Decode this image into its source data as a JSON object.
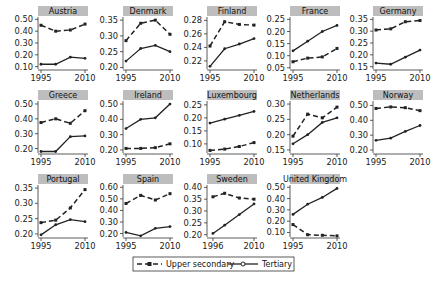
{
  "chart_data": {
    "type": "line",
    "layout": "small-multiples",
    "x": [
      1995,
      2000,
      2005,
      2010
    ],
    "legend": {
      "placement": "bottom-center",
      "entries": [
        {
          "name": "Upper secondary",
          "style": "dashed",
          "marker": "square"
        },
        {
          "name": "Tertiary",
          "style": "solid",
          "marker": "circle"
        }
      ]
    },
    "panels": [
      {
        "title": "Austria",
        "xticks": [
          "1995",
          "2010"
        ],
        "yticks": [
          "0.10",
          "0.20",
          "0.30",
          "0.40",
          "0.50"
        ],
        "ylim": [
          0.08,
          0.52
        ],
        "series": [
          {
            "name": "Upper secondary",
            "values": [
              0.45,
              0.4,
              0.41,
              0.46
            ]
          },
          {
            "name": "Tertiary",
            "values": [
              0.12,
              0.12,
              0.18,
              0.17
            ]
          }
        ]
      },
      {
        "title": "Denmark",
        "xticks": [
          "1995",
          "2010"
        ],
        "yticks": [
          "0.20",
          "0.25",
          "0.30",
          "0.35"
        ],
        "ylim": [
          0.195,
          0.36
        ],
        "series": [
          {
            "name": "Upper secondary",
            "values": [
              0.285,
              0.34,
              0.35,
              0.305
            ]
          },
          {
            "name": "Tertiary",
            "values": [
              0.22,
              0.26,
              0.27,
              0.25
            ]
          }
        ]
      },
      {
        "title": "Finland",
        "xticks": [
          "1995",
          "2010"
        ],
        "yticks": [
          "0.22",
          "0.24",
          "0.26",
          "0.28"
        ],
        "ylim": [
          0.208,
          0.285
        ],
        "series": [
          {
            "name": "Upper secondary",
            "values": [
              0.242,
              0.278,
              0.274,
              0.273
            ]
          },
          {
            "name": "Tertiary",
            "values": [
              0.212,
              0.238,
              0.245,
              0.253
            ]
          }
        ]
      },
      {
        "title": "France",
        "xticks": [
          "1995",
          "2010"
        ],
        "yticks": [
          "0.05",
          "0.10",
          "0.15",
          "0.20",
          "0.25"
        ],
        "ylim": [
          0.045,
          0.26
        ],
        "series": [
          {
            "name": "Upper secondary",
            "values": [
              0.075,
              0.09,
              0.095,
              0.13
            ]
          },
          {
            "name": "Tertiary",
            "values": [
              0.12,
              0.16,
              0.2,
              0.225
            ]
          }
        ]
      },
      {
        "title": "Germany",
        "xticks": [
          "1995",
          "2010"
        ],
        "yticks": [
          "0.15",
          "0.20",
          "0.25",
          "0.30",
          "0.35"
        ],
        "ylim": [
          0.14,
          0.36
        ],
        "series": [
          {
            "name": "Upper secondary",
            "values": [
              0.305,
              0.31,
              0.34,
              0.345
            ]
          },
          {
            "name": "Tertiary",
            "values": [
              0.165,
              0.16,
              0.19,
              0.22
            ]
          }
        ]
      },
      {
        "title": "Greece",
        "xticks": [
          "1995",
          "2010"
        ],
        "yticks": [
          "0.20",
          "0.30",
          "0.40",
          "0.50"
        ],
        "ylim": [
          0.17,
          0.52
        ],
        "series": [
          {
            "name": "Upper secondary",
            "values": [
              0.375,
              0.4,
              0.37,
              0.455
            ]
          },
          {
            "name": "Tertiary",
            "values": [
              0.18,
              0.18,
              0.28,
              0.285
            ]
          }
        ]
      },
      {
        "title": "Ireland",
        "xticks": [
          "1995",
          "2010"
        ],
        "yticks": [
          "0.20",
          "0.30",
          "0.40",
          "0.50"
        ],
        "ylim": [
          0.18,
          0.52
        ],
        "series": [
          {
            "name": "Upper secondary",
            "values": [
              0.21,
              0.21,
              0.215,
              0.24
            ]
          },
          {
            "name": "Tertiary",
            "values": [
              0.34,
              0.4,
              0.41,
              0.5
            ]
          }
        ]
      },
      {
        "title": "Luxembourg",
        "xticks": [
          "1995",
          "2010"
        ],
        "yticks": [
          "0.10",
          "0.15",
          "0.20",
          "0.25"
        ],
        "ylim": [
          0.065,
          0.265
        ],
        "series": [
          {
            "name": "Upper secondary",
            "values": [
              0.075,
              0.08,
              0.09,
              0.105
            ]
          },
          {
            "name": "Tertiary",
            "values": [
              0.18,
              0.195,
              0.21,
              0.225
            ]
          }
        ]
      },
      {
        "title": "Netherlands",
        "xticks": [
          "1995",
          "2010"
        ],
        "yticks": [
          "0.15",
          "0.20",
          "0.25",
          "0.30"
        ],
        "ylim": [
          0.14,
          0.31
        ],
        "series": [
          {
            "name": "Upper secondary",
            "values": [
              0.195,
              0.267,
              0.255,
              0.29
            ]
          },
          {
            "name": "Tertiary",
            "values": [
              0.17,
              0.2,
              0.24,
              0.255
            ]
          }
        ]
      },
      {
        "title": "Norway",
        "xticks": [
          "1995",
          "2010"
        ],
        "yticks": [
          "0.20",
          "0.30",
          "0.40",
          "0.50"
        ],
        "ylim": [
          0.18,
          0.53
        ],
        "series": [
          {
            "name": "Upper secondary",
            "values": [
              0.48,
              0.49,
              0.485,
              0.465
            ]
          },
          {
            "name": "Tertiary",
            "values": [
              0.265,
              0.28,
              0.325,
              0.365
            ]
          }
        ]
      },
      {
        "title": "Portugal",
        "xticks": [
          "1995",
          "2010"
        ],
        "yticks": [
          "0.20",
          "0.25",
          "0.30",
          "0.35"
        ],
        "ylim": [
          0.19,
          0.36
        ],
        "series": [
          {
            "name": "Upper secondary",
            "values": [
              0.237,
              0.245,
              0.285,
              0.345
            ]
          },
          {
            "name": "Tertiary",
            "values": [
              0.197,
              0.23,
              0.247,
              0.24
            ]
          }
        ]
      },
      {
        "title": "Spain",
        "xticks": [
          "1995",
          "2010"
        ],
        "yticks": [
          "0.20",
          "0.30",
          "0.40",
          "0.50",
          "0.60"
        ],
        "ylim": [
          0.17,
          0.62
        ],
        "series": [
          {
            "name": "Upper secondary",
            "values": [
              0.46,
              0.53,
              0.49,
              0.545
            ]
          },
          {
            "name": "Tertiary",
            "values": [
              0.21,
              0.18,
              0.245,
              0.26
            ]
          }
        ]
      },
      {
        "title": "Sweden",
        "x": [
          1996,
          2000,
          2005,
          2010
        ],
        "xticks": [
          "1996",
          "2010"
        ],
        "yticks": [
          "0.20",
          "0.25",
          "0.30",
          "0.35",
          "0.40"
        ],
        "ylim": [
          0.19,
          0.41
        ],
        "series": [
          {
            "name": "Upper secondary",
            "values": [
              0.36,
              0.375,
              0.355,
              0.35
            ]
          },
          {
            "name": "Tertiary",
            "values": [
              0.205,
              0.24,
              0.285,
              0.33
            ]
          }
        ]
      },
      {
        "title": "United Kingdom",
        "xticks": [
          "1995",
          "2010"
        ],
        "yticks": [
          "0.10",
          "0.20",
          "0.30",
          "0.40",
          "0.50"
        ],
        "ylim": [
          0.06,
          0.52
        ],
        "series": [
          {
            "name": "Upper secondary",
            "values": [
              0.17,
              0.08,
              0.075,
              0.07
            ]
          },
          {
            "name": "Tertiary",
            "values": [
              0.26,
              0.35,
              0.41,
              0.49
            ]
          }
        ]
      }
    ],
    "grid": false,
    "title": "",
    "xlabel": "",
    "ylabel": ""
  }
}
